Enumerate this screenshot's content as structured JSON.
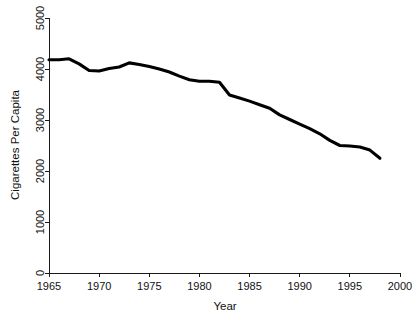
{
  "chart_data": {
    "type": "line",
    "title": "",
    "subtitle": "",
    "xlabel": "Year",
    "ylabel": "Cigarettes Per Capita",
    "xlim": [
      1965,
      2000
    ],
    "ylim": [
      0,
      5000
    ],
    "grid": false,
    "legend": null,
    "xticks": [
      1965,
      1970,
      1975,
      1980,
      1985,
      1990,
      1995,
      2000
    ],
    "xtick_labels": [
      "1965",
      "1970",
      "1975",
      "1980",
      "1985",
      "1990",
      "1995",
      "2000"
    ],
    "yticks": [
      0,
      1000,
      2000,
      3000,
      4000,
      5000
    ],
    "ytick_labels": [
      "0",
      "1000",
      "2000",
      "3000",
      "4000",
      "5000"
    ],
    "ytick_label_rotation": 90,
    "line_color": "#000000",
    "line_width": 3.1,
    "series": [
      {
        "name": "Cigarettes Per Capita",
        "x": [
          1965,
          1966,
          1967,
          1968,
          1969,
          1970,
          1971,
          1972,
          1973,
          1974,
          1975,
          1976,
          1977,
          1978,
          1979,
          1980,
          1981,
          1982,
          1983,
          1984,
          1985,
          1986,
          1987,
          1988,
          1989,
          1990,
          1991,
          1992,
          1993,
          1994,
          1995,
          1996,
          1997,
          1998
        ],
        "values": [
          4180,
          4180,
          4200,
          4100,
          3970,
          3960,
          4010,
          4040,
          4120,
          4090,
          4050,
          4000,
          3940,
          3860,
          3790,
          3760,
          3760,
          3740,
          3490,
          3430,
          3370,
          3300,
          3230,
          3100,
          3010,
          2920,
          2830,
          2730,
          2600,
          2500,
          2490,
          2470,
          2410,
          2250
        ]
      }
    ],
    "annotations": []
  },
  "axes": {
    "x_axis_name": "year-axis",
    "y_axis_name": "cigarettes-axis"
  }
}
